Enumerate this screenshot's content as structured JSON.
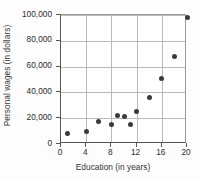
{
  "chart_data": {
    "type": "scatter",
    "title": "",
    "xlabel": "Education (in years)",
    "ylabel": "Personal wages (in dollars)",
    "xlim": [
      0,
      20
    ],
    "ylim": [
      0,
      100000
    ],
    "grid": true,
    "legend": null,
    "xticks": [
      "0",
      "4",
      "8",
      "12",
      "16",
      "20"
    ],
    "xtick_values": [
      0,
      4,
      8,
      12,
      16,
      20
    ],
    "yticks": [
      "0",
      "20,000",
      "40,000",
      "60,000",
      "80,000",
      "100,000"
    ],
    "ytick_values": [
      0,
      20000,
      40000,
      60000,
      80000,
      100000
    ],
    "marker_color": "#3a3a3a",
    "points": [
      {
        "x": 1,
        "y": 8000
      },
      {
        "x": 4,
        "y": 10000
      },
      {
        "x": 6,
        "y": 17500
      },
      {
        "x": 8,
        "y": 15500
      },
      {
        "x": 9,
        "y": 22000
      },
      {
        "x": 10,
        "y": 21000
      },
      {
        "x": 11,
        "y": 15500
      },
      {
        "x": 12,
        "y": 25500
      },
      {
        "x": 14,
        "y": 36000
      },
      {
        "x": 16,
        "y": 51000
      },
      {
        "x": 18,
        "y": 68000
      },
      {
        "x": 20,
        "y": 98000
      }
    ]
  }
}
